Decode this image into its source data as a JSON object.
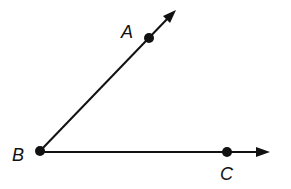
{
  "diagram": {
    "type": "geometry-angle",
    "colors": {
      "ink": "#111111",
      "background": "#ffffff"
    },
    "vertex": {
      "label": "B",
      "x": 40,
      "y": 151,
      "label_x": 12,
      "label_y": 161
    },
    "points": [
      {
        "label": "A",
        "x": 149,
        "y": 38,
        "label_x": 121,
        "label_y": 38
      },
      {
        "label": "C",
        "x": 227,
        "y": 152,
        "label_x": 220,
        "label_y": 180
      }
    ],
    "rays": [
      {
        "name": "ray-BA",
        "from": "B",
        "through": "A",
        "x1": 40,
        "y1": 151,
        "x2": 170,
        "y2": 16,
        "tip_x": 176,
        "tip_y": 10
      },
      {
        "name": "ray-BC",
        "from": "B",
        "through": "C",
        "x1": 40,
        "y1": 152,
        "x2": 260,
        "y2": 152,
        "tip_x": 270,
        "tip_y": 152
      }
    ]
  }
}
